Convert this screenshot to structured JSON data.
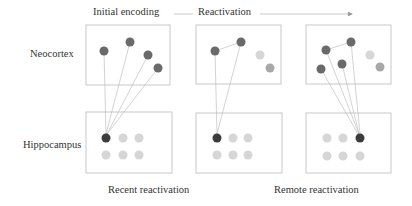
{
  "header": {
    "stage1": "Initial encoding",
    "stage2": "Reactivation"
  },
  "rows": {
    "top": "Neocortex",
    "bottom": "Hippocampus"
  },
  "footer": {
    "left": "Recent reactivation",
    "right": "Remote reactivation"
  },
  "colors": {
    "dark_node": "#6a6a6a",
    "active_hippo_node": "#3c3c3c",
    "light_node": "#d6d6d6",
    "medium_node": "#a8a8a8",
    "box_border": "#c8c8c8",
    "connection": "#b0b0b0"
  },
  "panels": [
    {
      "name": "initial-encoding",
      "neocortex_nodes": [
        {
          "state": "active"
        },
        {
          "state": "active"
        },
        {
          "state": "active"
        },
        {
          "state": "active"
        }
      ],
      "hippocampus_active_index": 0
    },
    {
      "name": "recent-reactivation",
      "neocortex_nodes": [
        {
          "state": "active"
        },
        {
          "state": "active"
        },
        {
          "state": "faded-light"
        },
        {
          "state": "faded-medium"
        }
      ],
      "hippocampus_active_index": 0
    },
    {
      "name": "remote-reactivation",
      "neocortex_nodes": [
        {
          "state": "active"
        },
        {
          "state": "active"
        },
        {
          "state": "active"
        },
        {
          "state": "active"
        },
        {
          "state": "faded-light"
        },
        {
          "state": "faded-medium"
        }
      ],
      "hippocampus_active_index": 2
    }
  ]
}
